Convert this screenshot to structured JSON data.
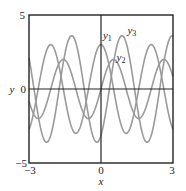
{
  "chart_data": {
    "type": "line",
    "title": "",
    "xlabel": "x",
    "ylabel": "y",
    "xlim": [
      -3,
      3
    ],
    "ylim": [
      -5,
      5
    ],
    "xticks": [
      -3,
      0,
      3
    ],
    "yticks": [
      -5,
      0,
      5
    ],
    "xtick_labels": [
      "−3",
      "0",
      "3"
    ],
    "ytick_labels": [
      "−5",
      "0",
      "5"
    ],
    "grid": false,
    "legend": "inline labels",
    "series": [
      {
        "name": "y1",
        "formula": "3cos(3x)",
        "amplitude": 3,
        "frequency": 3,
        "phase": 1.5708,
        "color": "#9a9a9a",
        "label": {
          "base": "y",
          "sub": "1",
          "x": 0.08,
          "y": 3.4
        }
      },
      {
        "name": "y2",
        "formula": "2sin(3x)",
        "amplitude": 2,
        "frequency": 3,
        "phase": 0,
        "color": "#9a9a9a",
        "label": {
          "base": "y",
          "sub": "2",
          "x": 0.65,
          "y": 1.9
        }
      },
      {
        "name": "y3",
        "formula": "3.6sin(3x-1.05)",
        "amplitude": 3.6,
        "frequency": 3,
        "phase": -1.05,
        "color": "#9a9a9a",
        "label": {
          "base": "y",
          "sub": "3",
          "x": 1.1,
          "y": 3.75
        }
      }
    ],
    "sample_points": {
      "x": [
        -3,
        -2.5,
        -2,
        -1.5,
        -1,
        -0.5,
        0,
        0.5,
        1,
        1.5,
        2,
        2.5,
        3
      ],
      "y1": [
        -2.73,
        1.04,
        2.88,
        -0.63,
        -2.97,
        0.21,
        3.0,
        0.21,
        -2.97,
        -0.63,
        2.88,
        1.04,
        -2.73
      ],
      "y2": [
        -0.82,
        -1.88,
        0.56,
        1.95,
        -0.28,
        -1.99,
        0.0,
        1.99,
        0.28,
        -1.95,
        -0.56,
        1.88,
        0.82
      ],
      "y3": [
        -3.36,
        0.37,
        3.33,
        -1.41,
        -3.2,
        1.9,
        -3.12,
        1.9,
        1.57,
        -2.77,
        0.87,
        3.5,
        -2.26
      ]
    }
  }
}
